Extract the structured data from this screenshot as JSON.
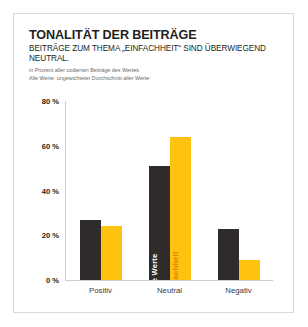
{
  "card": {
    "title": "TONALITÄT DER BEITRÄGE",
    "headline": "BEITRÄGE ZUM THEMA „EINFACHHEIT“ SIND ÜBERWIEGEND NEUTRAL.",
    "note_1": "in Prozent aller codierten Beiträge des Wertes",
    "note_2": "Alle Werte: ungewichteter Durchschnitt aller Werte"
  },
  "colors": {
    "dark": "#2e2b2a",
    "yellow": "#ffc20e",
    "inbar_yellow_text": "#e0820a",
    "border": "#d9d9d9",
    "axis": "#cfcfcf",
    "text": "#231f20",
    "note": "#6a6a6a"
  },
  "chart_data": {
    "type": "bar",
    "title": "TONALITÄT DER BEITRÄGE",
    "subtitle": "BEITRÄGE ZUM THEMA „EINFACHHEIT“ SIND ÜBERWIEGEND NEUTRAL.",
    "xlabel": "",
    "ylabel": "",
    "ylim": [
      0,
      80
    ],
    "yticks": [
      0,
      20,
      40,
      60,
      80
    ],
    "ytick_labels": [
      "0 %",
      "20 %",
      "40 %",
      "60 %",
      "80 %"
    ],
    "grid": false,
    "legend": "in-bar labels on Neutral group",
    "categories": [
      "Positiv",
      "Neutral",
      "Negativ"
    ],
    "series": [
      {
        "name": "Alle Werte",
        "color": "#2e2b2a",
        "values": [
          27,
          51,
          23
        ]
      },
      {
        "name": "Einfachheit",
        "color": "#ffc20e",
        "values": [
          24,
          64,
          9
        ]
      }
    ],
    "annotations": [
      {
        "text": "Alle Werte",
        "category": "Neutral",
        "series": "Alle Werte"
      },
      {
        "text": "Einfachheit",
        "category": "Neutral",
        "series": "Einfachheit"
      }
    ]
  }
}
